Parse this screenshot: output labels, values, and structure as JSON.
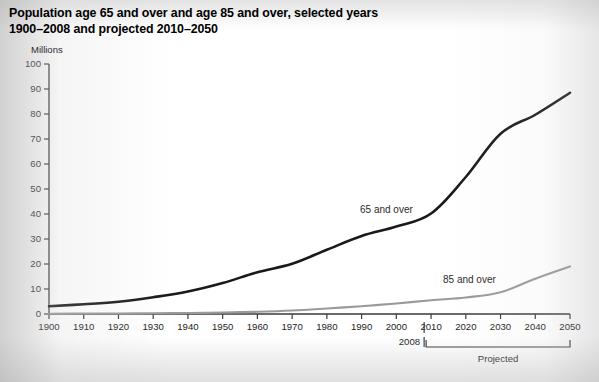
{
  "title": {
    "line1": "Population age 65 and over and age 85 and over, selected years",
    "line2": "1900–2008 and projected 2010–2050"
  },
  "axis_unit_label": "Millions",
  "annotations": {
    "projected_label": "Projected",
    "marker_2008": "2008",
    "projected_start_year": 2008,
    "projected_end_year": 2050
  },
  "colors": {
    "series_65_plus": "#1a1a1a",
    "series_85_plus": "#9a9a9a",
    "axis": "#3a3a3a",
    "text": "#1d1d1d",
    "background": "#ffffff"
  },
  "chart_data": {
    "type": "line",
    "title": "Population age 65 and over and age 85 and over, selected years 1900–2008 and projected 2010–2050",
    "xlabel": "",
    "ylabel": "Millions",
    "ylim": [
      0,
      100
    ],
    "xlim": [
      1900,
      2050
    ],
    "yticks": [
      0,
      10,
      20,
      30,
      40,
      50,
      60,
      70,
      80,
      90,
      100
    ],
    "xticks": [
      1900,
      1910,
      1920,
      1930,
      1940,
      1950,
      1960,
      1970,
      1980,
      1990,
      2000,
      2010,
      2020,
      2030,
      2040,
      2050
    ],
    "grid": false,
    "legend": "inline-labels",
    "x": [
      1900,
      1910,
      1920,
      1930,
      1940,
      1950,
      1960,
      1970,
      1980,
      1990,
      2000,
      2010,
      2020,
      2030,
      2040,
      2050
    ],
    "series": [
      {
        "name": "65 and over",
        "label": "65 and over",
        "color": "#1a1a1a",
        "values": [
          3.1,
          3.9,
          4.9,
          6.7,
          9.0,
          12.4,
          16.7,
          20.1,
          25.7,
          31.2,
          35.0,
          40.2,
          54.8,
          72.1,
          79.7,
          88.5
        ]
      },
      {
        "name": "85 and over",
        "label": "85 and over",
        "color": "#9a9a9a",
        "values": [
          0.1,
          0.2,
          0.2,
          0.3,
          0.4,
          0.6,
          0.9,
          1.4,
          2.2,
          3.1,
          4.2,
          5.5,
          6.6,
          8.7,
          14.1,
          19.0
        ]
      }
    ]
  }
}
